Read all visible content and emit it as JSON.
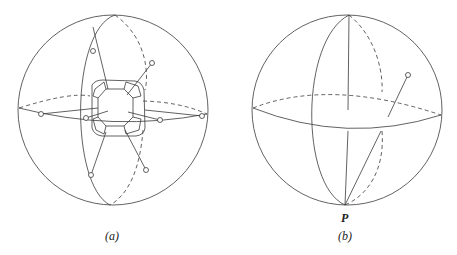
{
  "figure": {
    "panels": [
      {
        "id": "a",
        "label": "(a)",
        "description": "Sphere with polyhedral (truncated cube-like) core, great circles, and stems ending in small open circles"
      },
      {
        "id": "b",
        "label": "(b)",
        "point_label": "P",
        "description": "Sphere with equator and meridian great circles, a single stem ending in an open circle, chord from P"
      }
    ],
    "colors": {
      "stroke": "#3a3a3a",
      "background": "#ffffff"
    }
  }
}
